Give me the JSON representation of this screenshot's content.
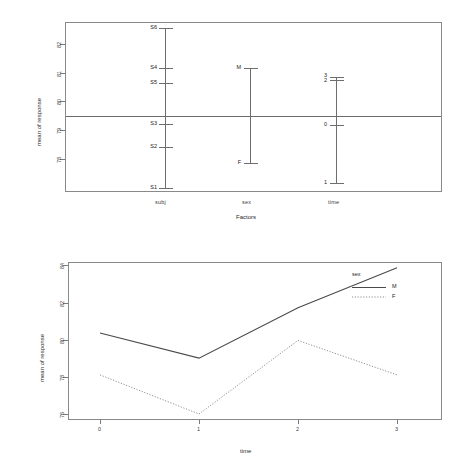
{
  "chart_data": [
    {
      "type": "scatter",
      "name": "design-plot",
      "title": "",
      "xlabel": "Factors",
      "ylabel": "mean of response",
      "ylim": [
        77.3,
        82.4
      ],
      "yticks": [
        78,
        79,
        80,
        81,
        82
      ],
      "grid": false,
      "grand_mean": 79.65,
      "categories": [
        "subj",
        "sex",
        "time"
      ],
      "factors": [
        {
          "name": "subj",
          "levels": [
            {
              "label": "S6",
              "value": 82.35
            },
            {
              "label": "S4",
              "value": 80.93
            },
            {
              "label": "S5",
              "value": 80.4
            },
            {
              "label": "S3",
              "value": 78.93
            },
            {
              "label": "S2",
              "value": 78.13
            },
            {
              "label": "S1",
              "value": 77.35
            }
          ]
        },
        {
          "name": "sex",
          "levels": [
            {
              "label": "M",
              "value": 81.26
            },
            {
              "label": "F",
              "value": 78.04
            }
          ]
        },
        {
          "name": "time",
          "levels": [
            {
              "label": "3",
              "value": 80.94
            },
            {
              "label": "2",
              "value": 80.83
            },
            {
              "label": "0",
              "value": 79.28
            },
            {
              "label": "1",
              "value": 77.52
            }
          ]
        }
      ]
    },
    {
      "type": "line",
      "name": "interaction-plot",
      "title": "",
      "xlabel": "time",
      "ylabel": "mean of response",
      "x": [
        0,
        1,
        2,
        3
      ],
      "xticks": [
        "0",
        "1",
        "2",
        "3"
      ],
      "yticks": [
        76,
        78,
        80,
        82,
        84
      ],
      "ylim": [
        75.8,
        84.1
      ],
      "grid": false,
      "legend_title": "sex",
      "legend_position": "top-right",
      "series": [
        {
          "name": "M",
          "style": "solid",
          "values": [
            80.35,
            79.0,
            81.7,
            83.85
          ]
        },
        {
          "name": "F",
          "style": "dotted",
          "values": [
            78.1,
            76.0,
            79.95,
            78.1
          ]
        }
      ]
    }
  ],
  "top_panel": {
    "ylabel": "mean of response",
    "xlabel": "Factors",
    "ytick_labels": [
      "82",
      "81",
      "80",
      "79",
      "78"
    ],
    "xtick_labels": [
      "subj",
      "sex",
      "time"
    ],
    "subj_levels": [
      "S6",
      "S4",
      "S5",
      "S3",
      "S2",
      "S1"
    ],
    "sex_levels": [
      "M",
      "F"
    ],
    "time_levels": [
      "3",
      "2",
      "0",
      "1"
    ]
  },
  "bottom_panel": {
    "ylabel": "mean of response",
    "xlabel": "time",
    "ytick_labels": [
      "84",
      "82",
      "80",
      "78",
      "76"
    ],
    "xtick_labels": [
      "0",
      "1",
      "2",
      "3"
    ],
    "legend_title": "sex",
    "legend_items": [
      "M",
      "F"
    ]
  },
  "colors": {
    "ink": "#000000",
    "frame": "#8a8a8a",
    "line": "#6e6e6e"
  }
}
